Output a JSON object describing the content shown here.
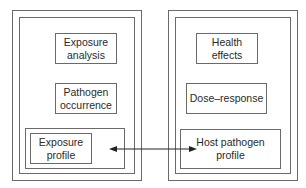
{
  "diagram": {
    "left_panel": {
      "boxes": [
        {
          "id": "exposure-analysis",
          "text": "Exposure\nanalysis"
        },
        {
          "id": "pathogen-occurrence",
          "text": "Pathogen\noccurrence"
        },
        {
          "id": "exposure-profile",
          "text": "Exposure\nprofile"
        }
      ]
    },
    "right_panel": {
      "boxes": [
        {
          "id": "health-effects",
          "text": "Health\neffects"
        },
        {
          "id": "dose-response",
          "text": "Dose–response"
        },
        {
          "id": "host-pathogen-profile",
          "text": "Host pathogen\nprofile"
        }
      ]
    },
    "connector": {
      "from": "exposure-profile",
      "to": "host-pathogen-profile",
      "type": "bidirectional-arrow"
    },
    "colors": {
      "line": "#6a6a6a",
      "text": "#2a2a2a",
      "arrow": "#222222"
    }
  }
}
